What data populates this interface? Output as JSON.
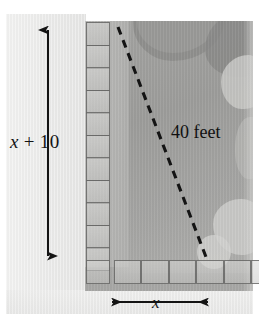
{
  "figure": {
    "name": "swimming-pool-dimension-diagram",
    "labels": {
      "vertical_dimension_var": "x",
      "vertical_dimension_op": " + ",
      "vertical_dimension_const": "10",
      "vertical_dimension_full": "x + 10",
      "horizontal_dimension": "x",
      "diagonal_measure": "40 feet"
    },
    "annotations": {
      "vertical_arrow": "double-headed vertical arrow spanning the height dimension",
      "horizontal_arrow": "double-headed horizontal arrow spanning the width dimension",
      "diagonal_line_style": "dashed"
    },
    "tiles": {
      "left_column_count": 11,
      "bottom_row_count": 6,
      "corner_shared": 1,
      "tile_size_px": 24
    },
    "colors": {
      "ink": "#131313",
      "tile_border": "#5a5a58",
      "deck": "#b3b3b1",
      "water": "#9d9d9b",
      "panel": "#ececeb",
      "page": "#ffffff"
    },
    "geometry": {
      "photo_left": 85,
      "photo_top": 21,
      "photo_width": 168,
      "photo_height": 270,
      "diagonal_start": [
        118,
        27
      ],
      "diagonal_end": [
        206,
        257
      ],
      "vertical_arrow_x": 48,
      "vertical_arrow_top": 28,
      "vertical_arrow_bottom": 258,
      "horizontal_arrow_y": 302,
      "horizontal_arrow_left": 110,
      "horizontal_arrow_right": 210
    }
  }
}
